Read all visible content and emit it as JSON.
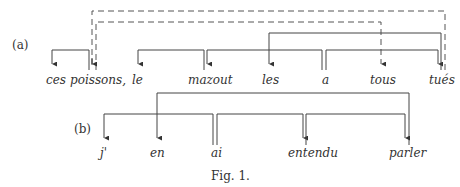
{
  "figure": {
    "caption": "Fig. 1.",
    "diagrams": [
      {
        "label": "(a)",
        "words": [
          "ces",
          "poissons,",
          "le",
          "mazout",
          "les",
          "a",
          "tous",
          "tués"
        ],
        "arcs": [
          {
            "from": "poissons,",
            "to": "ces",
            "style": "solid"
          },
          {
            "from": "mazout",
            "to": "le",
            "style": "solid"
          },
          {
            "from": "a",
            "to": "mazout",
            "style": "solid"
          },
          {
            "from": "a",
            "to": "tués",
            "style": "solid"
          },
          {
            "from": "tués",
            "to": "les",
            "style": "solid"
          },
          {
            "from": "tués",
            "to": "poissons,",
            "style": "dashed"
          },
          {
            "from": "poissons,",
            "to": "tous",
            "style": "dashed"
          }
        ]
      },
      {
        "label": "(b)",
        "words": [
          "j'",
          "en",
          "ai",
          "entendu",
          "parler"
        ],
        "arcs": [
          {
            "from": "ai",
            "to": "j'",
            "style": "solid"
          },
          {
            "from": "parler",
            "to": "en",
            "style": "solid"
          },
          {
            "from": "ai",
            "to": "entendu",
            "style": "solid"
          },
          {
            "from": "entendu",
            "to": "parler",
            "style": "solid"
          }
        ]
      }
    ]
  }
}
